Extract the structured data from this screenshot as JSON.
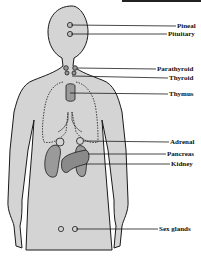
{
  "diagram": {
    "colors": {
      "body_fill": "#d4d4d4",
      "organ_fill": "#9a9a9a",
      "outline": "#1a1a1a",
      "background": "#ffffff"
    },
    "labels": [
      {
        "id": "pineal",
        "text": "Pineal"
      },
      {
        "id": "pituitary",
        "text": "Pituitary"
      },
      {
        "id": "parathyroid",
        "text": "Parathyroid"
      },
      {
        "id": "thyroid",
        "text": "Thyroid"
      },
      {
        "id": "thymus",
        "text": "Thymus"
      },
      {
        "id": "adrenal",
        "text": "Adrenal"
      },
      {
        "id": "pancreas",
        "text": "Pancreas"
      },
      {
        "id": "kidney",
        "text": "Kidney"
      },
      {
        "id": "sex-glands",
        "text": "Sex glands"
      }
    ]
  }
}
